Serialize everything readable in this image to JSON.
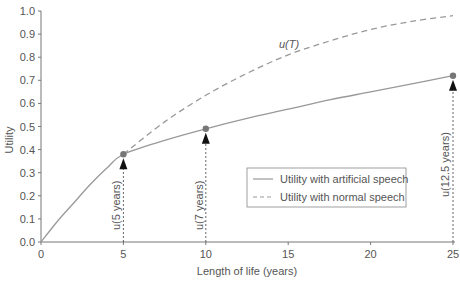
{
  "chart_data": {
    "type": "line",
    "title": "",
    "xlabel": "Length of life (years)",
    "ylabel": "Utility",
    "xlim": [
      0,
      25
    ],
    "ylim": [
      0,
      1.0
    ],
    "x_ticks": [
      0,
      5,
      10,
      15,
      20,
      25
    ],
    "x_tick_labels": [
      "0",
      "5",
      "10",
      "15",
      "20",
      "25"
    ],
    "y_ticks": [
      0.0,
      0.1,
      0.2,
      0.3,
      0.4,
      0.5,
      0.6,
      0.7,
      0.8,
      0.9,
      1.0
    ],
    "y_tick_labels": [
      "0.0",
      "0.1",
      "0.2",
      "0.3",
      "0.4",
      "0.5",
      "0.6",
      "0.7",
      "0.8",
      "0.9",
      "1.0"
    ],
    "grid": false,
    "legend_position": "lower right (inside)",
    "series": [
      {
        "name": "Utility with artificial speech",
        "style": "solid",
        "x": [
          0,
          1,
          2,
          3,
          4,
          5,
          7.5,
          10,
          12.5,
          15,
          17.5,
          20,
          22.5,
          25
        ],
        "y": [
          0.0,
          0.09,
          0.17,
          0.25,
          0.32,
          0.38,
          0.44,
          0.49,
          0.535,
          0.575,
          0.615,
          0.65,
          0.685,
          0.72
        ]
      },
      {
        "name": "Utility with normal speech",
        "style": "dashed",
        "x": [
          5,
          7.5,
          10,
          12.5,
          15,
          17.5,
          20,
          22.5,
          25
        ],
        "y": [
          0.38,
          0.52,
          0.635,
          0.73,
          0.81,
          0.87,
          0.92,
          0.955,
          0.98
        ]
      }
    ],
    "markers": [
      {
        "x": 5,
        "y": 0.38,
        "label": "u(5 years)"
      },
      {
        "x": 10,
        "y": 0.49,
        "label": "u(7 years)"
      },
      {
        "x": 25,
        "y": 0.72,
        "label": "u(12.5 years)"
      }
    ],
    "annotations": [
      {
        "text": "u(T)",
        "x": 15,
        "y": 0.86
      }
    ]
  },
  "labels": {
    "xlabel": "Length of life (years)",
    "ylabel": "Utility",
    "curve_label": "u(T)",
    "legend_solid": "Utility with artificial speech",
    "legend_dashed": "Utility with normal speech",
    "marker_5": "u(5 years)",
    "marker_10": "u(7 years)",
    "marker_25": "u(12.5 years)"
  },
  "colors": {
    "axis": "#777777",
    "line": "#999999",
    "marker": "#777777",
    "arrow": "#111111",
    "text": "#555555"
  }
}
